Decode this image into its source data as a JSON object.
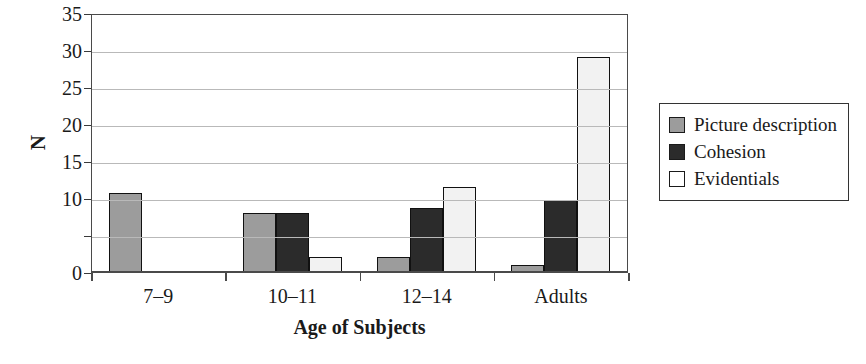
{
  "chart_data": {
    "type": "bar",
    "title": "",
    "xlabel": "Age of Subjects",
    "ylabel": "N",
    "categories": [
      "7–9",
      "10–11",
      "12–14",
      "Adults"
    ],
    "series": [
      {
        "name": "Picture description",
        "color": "#9c9c9c",
        "values": [
          10.7,
          8,
          2,
          1
        ]
      },
      {
        "name": "Cohesion",
        "color": "#2b2b2b",
        "values": [
          0,
          8,
          8.7,
          9.7
        ]
      },
      {
        "name": "Evidentials",
        "color": "#f2f2f2",
        "values": [
          0,
          2,
          11.5,
          29
        ]
      }
    ],
    "ylim": [
      0,
      35
    ],
    "yticks": [
      0,
      5,
      10,
      15,
      20,
      25,
      30,
      35
    ],
    "ytick_labels": [
      "0",
      "",
      "10",
      "15",
      "20",
      "25",
      "30",
      "35"
    ],
    "grid": "horizontal",
    "legend_position": "right"
  },
  "legend": {
    "items": [
      {
        "label": "Picture description",
        "swatch": "#9c9c9c"
      },
      {
        "label": "Cohesion",
        "swatch": "#2b2b2b"
      },
      {
        "label": "Evidentials",
        "swatch": "#ffffff"
      }
    ]
  }
}
